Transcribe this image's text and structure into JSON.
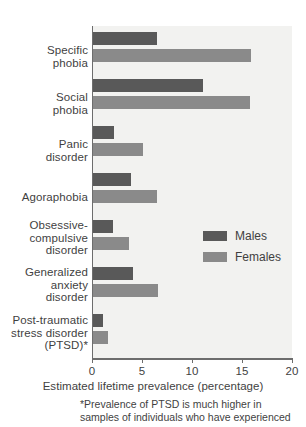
{
  "chart_data": {
    "type": "bar",
    "orientation": "horizontal",
    "title": "",
    "xlabel": "Estimated lifetime prevalence (percentage)",
    "ylabel": "",
    "xlim": [
      0,
      20
    ],
    "xticks": [
      0,
      5,
      10,
      15,
      20
    ],
    "xtick_labels": [
      "0",
      "5",
      "10",
      "15",
      "20"
    ],
    "grid": false,
    "legend_position": "center-right",
    "categories": [
      "Specific\nphobia",
      "Social\nphobia",
      "Panic\ndisorder",
      "Agoraphobia",
      "Obsessive-\ncompulsive\ndisorder",
      "Generalized\nanxiety\ndisorder",
      "Post-traumatic\nstress disorder\n(PTSD)*"
    ],
    "series": [
      {
        "name": "Males",
        "color": "#595959",
        "values": [
          6.4,
          11.0,
          2.1,
          3.8,
          2.0,
          4.0,
          1.0
        ]
      },
      {
        "name": "Females",
        "color": "#8a8a8a",
        "values": [
          15.8,
          15.7,
          5.0,
          6.4,
          3.6,
          6.5,
          1.5
        ]
      }
    ],
    "annotations": [
      "*Prevalence of PTSD is much higher in",
      "samples of individuals who have experienced"
    ]
  },
  "categories": [
    {
      "id": "specific-phobia",
      "lines": [
        "Specific",
        "phobia"
      ]
    },
    {
      "id": "social-phobia",
      "lines": [
        "Social",
        "phobia"
      ]
    },
    {
      "id": "panic-disorder",
      "lines": [
        "Panic",
        "disorder"
      ]
    },
    {
      "id": "agoraphobia",
      "lines": [
        "Agoraphobia"
      ]
    },
    {
      "id": "ocd",
      "lines": [
        "Obsessive-",
        "compulsive",
        "disorder"
      ]
    },
    {
      "id": "gad",
      "lines": [
        "Generalized",
        "anxiety",
        "disorder"
      ]
    },
    {
      "id": "ptsd",
      "lines": [
        "Post-traumatic",
        "stress disorder",
        "(PTSD)*"
      ]
    }
  ],
  "axis": {
    "title": "Estimated lifetime prevalence (percentage)",
    "ticks": [
      "0",
      "5",
      "10",
      "15",
      "20"
    ]
  },
  "legend": {
    "males_label": "Males",
    "females_label": "Females",
    "males_color": "#595959",
    "females_color": "#8a8a8a"
  },
  "footnote": {
    "line1": "*Prevalence of PTSD is much higher in",
    "line2": "samples of individuals who have experienced"
  },
  "cat_labels": {
    "0": {
      "0": "Specific",
      "1": "phobia"
    },
    "1": {
      "0": "Social",
      "1": "phobia"
    },
    "2": {
      "0": "Panic",
      "1": "disorder"
    },
    "3": {
      "0": "Agoraphobia"
    },
    "4": {
      "0": "Obsessive-",
      "1": "compulsive",
      "2": "disorder"
    },
    "5": {
      "0": "Generalized",
      "1": "anxiety",
      "2": "disorder"
    },
    "6": {
      "0": "Post-traumatic",
      "1": "stress disorder",
      "2": "(PTSD)*"
    }
  }
}
